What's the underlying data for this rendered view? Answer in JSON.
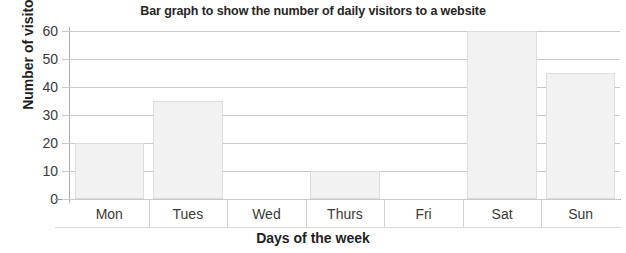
{
  "chart_data": {
    "type": "bar",
    "title": "Bar graph to show the number of daily visitors to a website",
    "xlabel": "Days of the week",
    "ylabel": "Number of visitors",
    "categories": [
      "Mon",
      "Tues",
      "Wed",
      "Thurs",
      "Fri",
      "Sat",
      "Sun"
    ],
    "values": [
      20,
      35,
      0,
      10,
      0,
      60,
      45
    ],
    "ylim": [
      0,
      60
    ],
    "ytick_labels": [
      "60",
      "50",
      "40",
      "30",
      "20",
      "10",
      "0"
    ],
    "ytick_values": [
      60,
      50,
      40,
      30,
      20,
      10,
      0
    ],
    "ytick_step": 10,
    "grid": true,
    "legend": "none",
    "bar_fill_color": "#f2f2f2",
    "bar_border_color": "#dddddd",
    "gridline_color": "#c9c9c9",
    "axis_color": "#9a9a9a",
    "text_color": "#262626"
  }
}
